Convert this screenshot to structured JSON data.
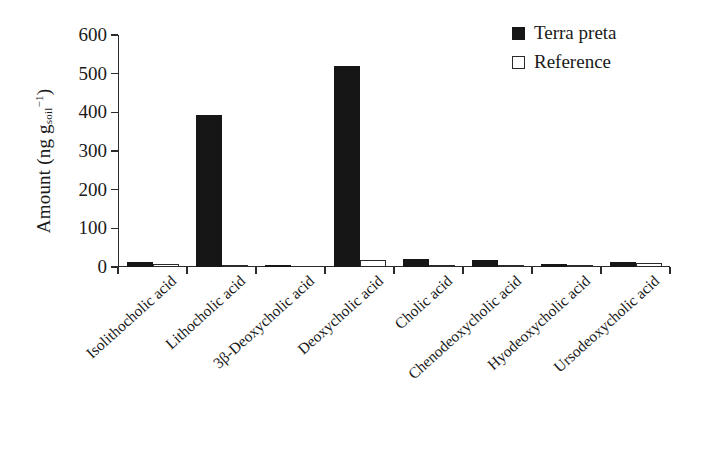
{
  "chart_data": {
    "type": "bar",
    "title": "",
    "xlabel": "",
    "ylabel": "Amount (ng g_soil^-1)",
    "ylabel_parts": {
      "prefix": "Amount (ng g",
      "sub": "soil",
      "sup": "−1",
      "suffix": ")"
    },
    "ylim": [
      0,
      600
    ],
    "yticks": [
      0,
      100,
      200,
      300,
      400,
      500,
      600
    ],
    "ytick_labels": [
      "0",
      "100",
      "200",
      "300",
      "400",
      "500",
      "600"
    ],
    "grid": false,
    "legend_position": "top-right",
    "categories": [
      "Isolithocholic acid",
      "Lithocholic acid",
      "3β-Deoxycholic acid",
      "Deoxycholic acid",
      "Cholic acid",
      "Chenodeoxycholic acid",
      "Hyodeoxycholic acid",
      "Ursodeoxycholic acid"
    ],
    "series": [
      {
        "name": "Terra preta",
        "color": "#161616",
        "style": "filled",
        "values": [
          14,
          392,
          5,
          521,
          20,
          19,
          9,
          12
        ]
      },
      {
        "name": "Reference",
        "color": "#ffffff",
        "style": "open",
        "values": [
          7,
          1,
          0,
          18,
          5,
          4,
          2,
          10
        ]
      }
    ]
  },
  "legend": {
    "items": [
      {
        "label": "Terra preta",
        "style": "filled"
      },
      {
        "label": "Reference",
        "style": "open"
      }
    ]
  },
  "axis": {
    "y_tick_labels": [
      "600",
      "500",
      "400",
      "300",
      "200",
      "100",
      "0"
    ]
  },
  "colors": {
    "bar_filled": "#161616",
    "bar_open": "#ffffff",
    "axis": "#2b2b2b",
    "text": "#1a1a1a",
    "background": "#ffffff"
  }
}
